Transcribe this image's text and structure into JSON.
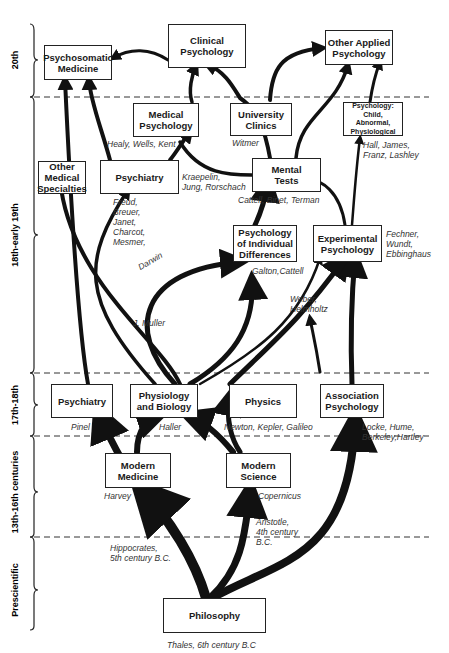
{
  "eras": [
    {
      "label": "20th"
    },
    {
      "label": "18th-early 19th"
    },
    {
      "label": "17th-18th"
    },
    {
      "label": "13th-16th centuries"
    },
    {
      "label": "Prescientific"
    }
  ],
  "nodes": {
    "psychosomatic": "Psychosomatic\nMedicine",
    "clinical": "Clinical\nPsychology",
    "other_applied": "Other Applied\nPsychology",
    "medical_psych": "Medical\nPsychology",
    "university_clinics": "University\nClinics",
    "psych_child": "Psychology:\nChild,\nAbnormal,\nPhysiological",
    "other_medical": "Other\nMedical\nSpecialties",
    "psychiatry_modern": "Psychiatry",
    "mental_tests": "Mental\nTests",
    "individual_diff": "Psychology\nof Individual\nDifferences",
    "experimental": "Experimental\nPsychology",
    "psychiatry_early": "Psychiatry",
    "physiology": "Physiology\nand Biology",
    "physics": "Physics",
    "association": "Association\nPsychology",
    "modern_medicine": "Modern\nMedicine",
    "modern_science": "Modern\nScience",
    "philosophy": "Philosophy"
  },
  "notes": {
    "healy": "Healy, Wells, Kent",
    "witmer": "Witmer",
    "hall": "Hall, James,\nFranz, Lashley",
    "kraepelin": "Kraepelin,\nJung, Rorschach",
    "cattell_binet": "Cattell, Binet, Terman",
    "freud": "Freud,\n Breuer,\n  Janet,\n Charcot,\nMesmer,",
    "fechner": "Fechner,\nWundt,\nEbbinghaus",
    "darwin": "Darwin",
    "galton": "Galton,Cattell",
    "weber": "Weber,\nHelmholtz",
    "muller": "J. Muller",
    "pinel": "Pinel",
    "haller": "Haller",
    "newton": "Newton, Kepler, Galileo",
    "locke": "Locke, Hume,\nBerkeley,Hartley",
    "harvey": "Harvey",
    "copernicus": "Copernicus",
    "aristotle": "Aristotle,\n4th century\nB.C.",
    "hippocrates": "Hippocrates,\n5th century B.C.",
    "thales": "Thales, 6th century B.C"
  }
}
